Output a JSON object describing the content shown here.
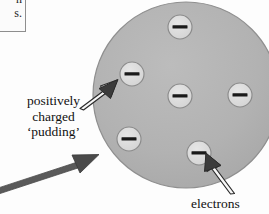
{
  "figure": {
    "background_color": "#fdfdfd"
  },
  "clipped_note": {
    "line1": "n",
    "line2": "s.",
    "border_color": "#8e8e8e",
    "background_color": "#fbfbfb"
  },
  "labels": {
    "pudding": "positively\ncharged\n‘pudding’",
    "electrons": "electrons"
  },
  "sphere": {
    "name": "positive-charge-sphere",
    "fill_color": "#b0b0b0",
    "stroke_color": "#8f8f8f",
    "center_x": 186,
    "center_y": 95,
    "radius": 93
  },
  "electrons": [
    {
      "id": "electron-top",
      "cx": 180,
      "cy": 27,
      "r": 12
    },
    {
      "id": "electron-upper-left",
      "cx": 132,
      "cy": 74,
      "r": 12
    },
    {
      "id": "electron-center",
      "cx": 180,
      "cy": 96,
      "r": 12
    },
    {
      "id": "electron-right",
      "cx": 240,
      "cy": 95,
      "r": 12
    },
    {
      "id": "electron-lower-left",
      "cx": 129,
      "cy": 139,
      "r": 12
    },
    {
      "id": "electron-lower-right",
      "cx": 199,
      "cy": 153,
      "r": 12
    }
  ],
  "electron_symbol": {
    "sign": "minus",
    "fill_color": "#dcdcdc",
    "stroke_color": "#8a8a8a",
    "bar_color": "#1a1a1a"
  },
  "arrows": [
    {
      "id": "arrow-pudding",
      "style": "outline",
      "from_x": 82,
      "from_y": 107,
      "to_x": 113,
      "to_y": 84,
      "fill_color": "#f7f7f7",
      "stroke_color": "#2b2b2b"
    },
    {
      "id": "arrow-electrons",
      "style": "outline",
      "from_x": 228,
      "from_y": 193,
      "to_x": 203,
      "to_y": 160,
      "fill_color": "#f7f7f7",
      "stroke_color": "#2b2b2b"
    },
    {
      "id": "arrow-long-bottom-left",
      "style": "solid",
      "from_x": -6,
      "from_y": 187,
      "to_x": 96,
      "to_y": 154,
      "fill_color": "#4a4a4a",
      "stroke_color": "#3a3a3a"
    }
  ]
}
